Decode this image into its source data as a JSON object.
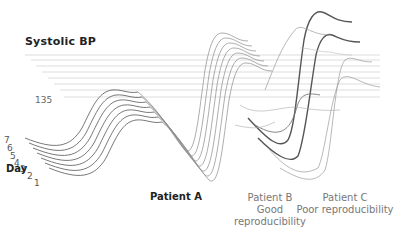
{
  "figure": {
    "title": "Systolic  BP",
    "y_tick": "135",
    "axis_label": "Day",
    "days": [
      "1",
      "2",
      "3",
      "4",
      "5",
      "6",
      "7"
    ],
    "panels": [
      {
        "name": "Patient  A",
        "subtitle": ""
      },
      {
        "name": "Patient  B",
        "subtitle": "Good reproducibility"
      },
      {
        "name": "Patient C",
        "subtitle": "Poor reproducibility"
      }
    ]
  },
  "colors": {
    "grid": "#cfcfcf",
    "trace_a": "#555555",
    "trace_b": "#8a8a8a",
    "trace_c_dark": "#555555",
    "trace_c_light": "#9a9a9a",
    "label_dark": "#222222",
    "label_grey": "#777777"
  }
}
